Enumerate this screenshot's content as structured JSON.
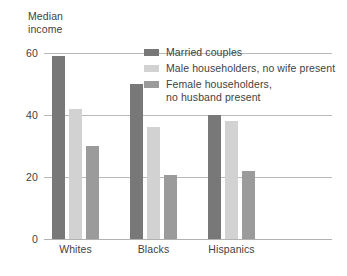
{
  "chart_data": {
    "type": "bar",
    "title": "",
    "subtitle": "",
    "ylabel": "Median\nincome",
    "xlabel": "",
    "categories": [
      "Whites",
      "Blacks",
      "Hispanics"
    ],
    "series": [
      {
        "name": "Married couples",
        "color": "#787878",
        "values": [
          59,
          50,
          40
        ]
      },
      {
        "name": "Male householders, no wife present",
        "color": "#d2d2d2",
        "values": [
          42,
          36,
          38
        ]
      },
      {
        "name": "Female householders,\nno husband present",
        "color": "#9b9b9b",
        "values": [
          30,
          20.5,
          22
        ]
      }
    ],
    "ylim": [
      0,
      60
    ],
    "yticks": [
      0,
      20,
      40,
      60
    ],
    "ytick_labels": [
      "0",
      "20",
      "40",
      "60"
    ],
    "grid": true,
    "grid_color": "#b9b9b9",
    "legend_position": "upper-right-inside",
    "background": "#ffffff",
    "text_color": "#3f3f3f"
  }
}
